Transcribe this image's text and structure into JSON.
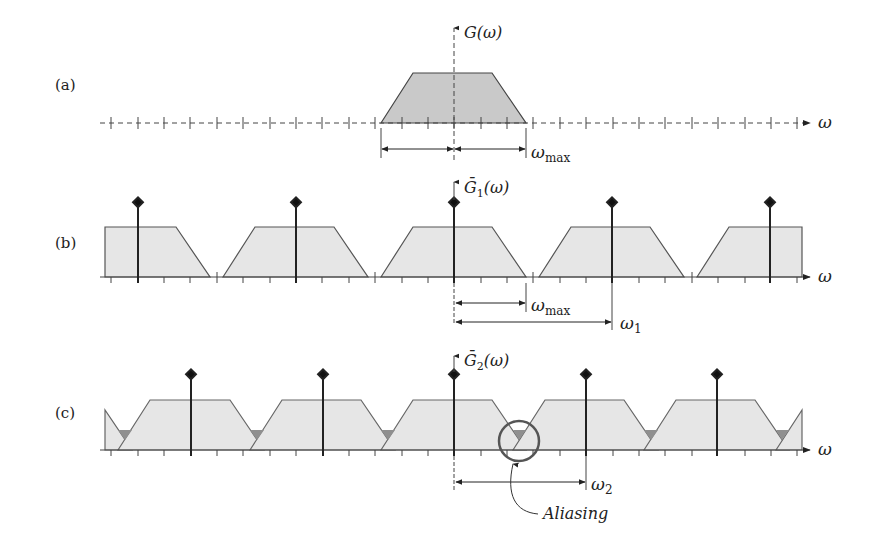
{
  "panels": {
    "a": {
      "label": "(a)",
      "axis_title": "G(ω)",
      "x_axis_label": "ω",
      "omega_max_label": "ω",
      "omega_max_sub": "max"
    },
    "b": {
      "label": "(b)",
      "axis_title_main": "Ḡ",
      "axis_title_sub": "1",
      "axis_title_rest": "(ω)",
      "x_axis_label": "ω",
      "omega_max_label": "ω",
      "omega_max_sub": "max",
      "omega_s_label": "ω",
      "omega_s_sub": "1"
    },
    "c": {
      "label": "(c)",
      "axis_title_main": "Ḡ",
      "axis_title_sub": "2",
      "axis_title_rest": "(ω)",
      "x_axis_label": "ω",
      "omega_s_label": "ω",
      "omega_s_sub": "2",
      "annotation": "Aliasing"
    }
  },
  "colors": {
    "spectrum_fill_a": "#c9c9c9",
    "spectrum_fill_bc": "#e6e6e6",
    "overlap_fill": "#8f8f8f",
    "line": "#333333",
    "circle": "#555555"
  }
}
